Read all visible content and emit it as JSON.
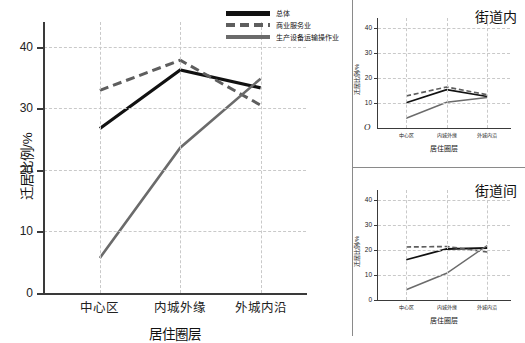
{
  "chart_data": [
    {
      "type": "line",
      "id": "main",
      "title": "",
      "xlabel": "居住圈层",
      "ylabel": "迁居比例/%",
      "categories": [
        "中心区",
        "内城外缘",
        "外城内沿"
      ],
      "ylim": [
        0,
        44
      ],
      "yticks": [
        0,
        10,
        20,
        30,
        40
      ],
      "grid": true,
      "series": [
        {
          "name": "总体",
          "style": "solid-black",
          "values": [
            26.7,
            36.2,
            33.3
          ]
        },
        {
          "name": "商业服务业",
          "style": "dashed-gray",
          "values": [
            32.9,
            37.8,
            30.5
          ]
        },
        {
          "name": "生产设备运输操作业",
          "style": "solid-gray",
          "values": [
            5.7,
            23.6,
            34.8
          ]
        }
      ]
    },
    {
      "type": "line",
      "id": "top-right",
      "title": "街道内",
      "xlabel": "居住圈层",
      "ylabel": "迁居比例/%",
      "categories": [
        "中心区",
        "内城外缘",
        "外城内沿"
      ],
      "ylim": [
        0,
        44
      ],
      "yticks": [
        10,
        20,
        30,
        40
      ],
      "grid": true,
      "series": [
        {
          "name": "总体",
          "style": "solid-black",
          "values": [
            10.1,
            15.3,
            12.6
          ]
        },
        {
          "name": "商业服务业",
          "style": "dashed-gray",
          "values": [
            12.8,
            16.4,
            13.3
          ]
        },
        {
          "name": "生产设备运输操作业",
          "style": "solid-gray",
          "values": [
            3.9,
            10.3,
            12.2
          ]
        }
      ]
    },
    {
      "type": "line",
      "id": "bottom-right",
      "title": "街道间",
      "xlabel": "居住圈层",
      "ylabel": "迁居比例/%",
      "categories": [
        "中心区",
        "内城外缘",
        "外城内沿"
      ],
      "ylim": [
        0,
        44
      ],
      "yticks": [
        0,
        10,
        20,
        30,
        40
      ],
      "grid": true,
      "series": [
        {
          "name": "总体",
          "style": "solid-black",
          "values": [
            16.1,
            20.4,
            20.8
          ]
        },
        {
          "name": "商业服务业",
          "style": "dashed-gray",
          "values": [
            21.2,
            21.4,
            19.2
          ]
        },
        {
          "name": "生产设备运输操作业",
          "style": "solid-gray",
          "values": [
            4.1,
            10.7,
            21.8
          ]
        }
      ]
    }
  ],
  "legend": {
    "position": "top-right",
    "items": [
      {
        "label": "总体",
        "style": "solid-black"
      },
      {
        "label": "商业服务业",
        "style": "dashed-gray"
      },
      {
        "label": "生产设备运输操作业",
        "style": "solid-gray"
      }
    ]
  },
  "origin_marker": "O",
  "colors": {
    "total": "#111111",
    "service": "#5e5e5e",
    "production": "#6b6b6b",
    "axis": "#3a3a3a",
    "grid": "#c9c9c9",
    "background": "#ffffff"
  }
}
